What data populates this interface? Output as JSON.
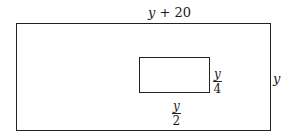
{
  "diagram": {
    "outer_rect": {
      "top_label": {
        "var": "y",
        "rest": " + 20"
      },
      "right_label": "y"
    },
    "inner_rect": {
      "right_label": {
        "numerator": "y",
        "denominator": "4"
      },
      "bottom_label": {
        "numerator": "y",
        "denominator": "2"
      }
    }
  }
}
